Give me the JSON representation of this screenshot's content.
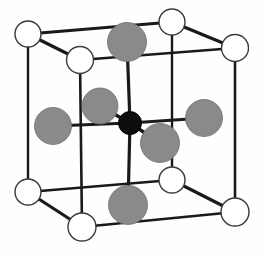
{
  "figure": {
    "background_color": "#fefefe",
    "width": 262,
    "height": 255
  },
  "colors": {
    "corner_atom_fill": "#ffffff",
    "corner_atom_stroke": "#3a3a3a",
    "ligand_atom_fill": "#8a8a8a",
    "ligand_atom_stroke": "#6f6f6f",
    "center_atom_fill": "#0d0d0d",
    "edge_stroke": "#1a1a1a",
    "bond_stroke": "#1a1a1a"
  },
  "geometry": {
    "cube_vertices": {
      "back_top_left": {
        "x": 28,
        "y": 34
      },
      "back_top_right": {
        "x": 172,
        "y": 22
      },
      "front_top_left": {
        "x": 80,
        "y": 60
      },
      "front_top_right": {
        "x": 235,
        "y": 48
      },
      "back_bottom_left": {
        "x": 28,
        "y": 192
      },
      "back_bottom_right": {
        "x": 172,
        "y": 180
      },
      "front_bottom_left": {
        "x": 82,
        "y": 227
      },
      "front_bottom_right": {
        "x": 235,
        "y": 212
      }
    },
    "edges": [
      {
        "name": "top-back",
        "from": "back_top_left",
        "to": "back_top_right",
        "width": 3.0
      },
      {
        "name": "top-left-diagonal",
        "from": "back_top_left",
        "to": "front_top_left",
        "width": 3.2
      },
      {
        "name": "top-right-diagonal",
        "from": "back_top_right",
        "to": "front_top_right",
        "width": 3.2
      },
      {
        "name": "top-front",
        "from": "front_top_left",
        "to": "front_top_right",
        "width": 2.6
      },
      {
        "name": "vertical-back-left",
        "from": "back_top_left",
        "to": "back_bottom_left",
        "width": 2.4
      },
      {
        "name": "vertical-back-right",
        "from": "back_top_right",
        "to": "back_bottom_right",
        "width": 2.4
      },
      {
        "name": "vertical-front-left",
        "from": "front_top_left",
        "to": "front_bottom_left",
        "width": 2.6
      },
      {
        "name": "vertical-front-right",
        "from": "front_top_right",
        "to": "front_bottom_right",
        "width": 2.6
      },
      {
        "name": "bottom-back",
        "from": "back_bottom_left",
        "to": "back_bottom_right",
        "width": 2.4
      },
      {
        "name": "bottom-left-diagonal",
        "from": "back_bottom_left",
        "to": "front_bottom_left",
        "width": 3.2
      },
      {
        "name": "bottom-right-diagonal",
        "from": "back_bottom_right",
        "to": "front_bottom_right",
        "width": 3.2
      },
      {
        "name": "bottom-front",
        "from": "front_bottom_left",
        "to": "front_bottom_right",
        "width": 2.6
      }
    ],
    "center_atom": {
      "x": 130,
      "y": 123,
      "radius": 11.5
    },
    "ligand_atoms": [
      {
        "name": "ligand-top",
        "x": 127,
        "y": 42,
        "radius": 19.5
      },
      {
        "name": "ligand-bottom",
        "x": 128,
        "y": 205,
        "radius": 19.5
      },
      {
        "name": "ligand-left",
        "x": 53,
        "y": 126,
        "radius": 18.5
      },
      {
        "name": "ligand-right",
        "x": 204,
        "y": 118,
        "radius": 18.5
      },
      {
        "name": "ligand-back-upper",
        "x": 100,
        "y": 106,
        "radius": 18.0
      },
      {
        "name": "ligand-front-lower",
        "x": 160,
        "y": 143,
        "radius": 19.5
      }
    ],
    "bonds": [
      {
        "name": "bond-center-top",
        "to": "ligand-top",
        "width": 3.2
      },
      {
        "name": "bond-center-bottom",
        "to": "ligand-bottom",
        "width": 3.2
      },
      {
        "name": "bond-center-left",
        "to": "ligand-left",
        "width": 3.0
      },
      {
        "name": "bond-center-right",
        "to": "ligand-right",
        "width": 3.0
      },
      {
        "name": "bond-center-back-upper",
        "to": "ligand-back-upper",
        "width": 3.4
      },
      {
        "name": "bond-center-front-lower",
        "to": "ligand-front-lower",
        "width": 3.4
      }
    ],
    "corner_atom_radius": 13.5,
    "corner_atoms": [
      {
        "name": "corner-back-top-left",
        "vertex": "back_top_left",
        "radius": 13.0
      },
      {
        "name": "corner-back-top-right",
        "vertex": "back_top_right",
        "radius": 13.0
      },
      {
        "name": "corner-front-top-left",
        "vertex": "front_top_left",
        "radius": 13.5
      },
      {
        "name": "corner-front-top-right",
        "vertex": "front_top_right",
        "radius": 13.5
      },
      {
        "name": "corner-back-bottom-left",
        "vertex": "back_bottom_left",
        "radius": 13.0
      },
      {
        "name": "corner-back-bottom-right",
        "vertex": "back_bottom_right",
        "radius": 13.0
      },
      {
        "name": "corner-front-bottom-left",
        "vertex": "front_bottom_left",
        "radius": 14.0
      },
      {
        "name": "corner-front-bottom-right",
        "vertex": "front_bottom_right",
        "radius": 14.0
      }
    ]
  },
  "legend": {
    "corner_atom_label": "corner atom",
    "ligand_atom_label": "ligand atom",
    "center_atom_label": "central atom"
  }
}
